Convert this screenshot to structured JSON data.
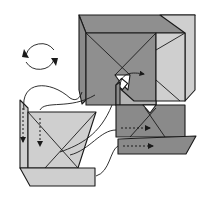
{
  "diagram": {
    "type": "origami-folding-diagram",
    "colors": {
      "dark_gray": "#8a8a8a",
      "mid_gray": "#a8a8a8",
      "light_gray": "#cfcfcf",
      "white": "#ffffff",
      "line": "#1a1a1a"
    },
    "symbols": [
      {
        "name": "rotate-symbol",
        "meaning": "turn model over / rotate"
      },
      {
        "name": "tuck-arrow",
        "meaning": "insert flap into pocket"
      },
      {
        "name": "push-arrow-dashed",
        "meaning": "slide flap in direction shown"
      }
    ],
    "units": [
      {
        "name": "upper-right-unit",
        "shade": "dark_gray"
      },
      {
        "name": "lower-right-unit",
        "shade": "dark_gray"
      },
      {
        "name": "lower-left-unit",
        "shade": "light_gray"
      }
    ]
  }
}
